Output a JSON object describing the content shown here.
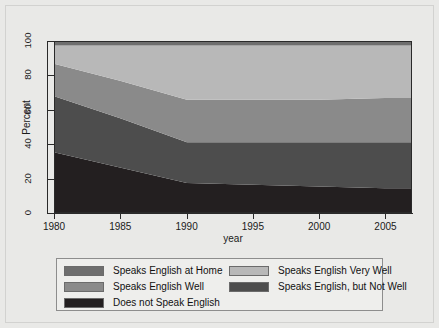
{
  "chart_data": {
    "type": "area",
    "title": "",
    "xlabel": "year",
    "ylabel": "Percent",
    "xlim": [
      1980,
      2007
    ],
    "ylim": [
      0,
      100
    ],
    "xticks": [
      1980,
      1985,
      1990,
      1995,
      2000,
      2005
    ],
    "yticks": [
      0,
      20,
      40,
      60,
      80,
      100
    ],
    "grid": false,
    "stacked": true,
    "stack_order_bottom_to_top": [
      "Does not Speak English",
      "Speaks English, but Not Well",
      "Speaks English Well",
      "Speaks English Very Well",
      "Speaks English at Home"
    ],
    "x": [
      1980,
      1985,
      1990,
      1995,
      2000,
      2005,
      2007
    ],
    "series": [
      {
        "name": "Does not Speak English",
        "color": "#231f20",
        "values": [
          35,
          26,
          17,
          16,
          15,
          14,
          14
        ]
      },
      {
        "name": "Speaks English, but Not Well",
        "color": "#4d4d4d",
        "values": [
          33,
          29,
          24,
          25,
          26,
          27,
          27
        ]
      },
      {
        "name": "Speaks English Well",
        "color": "#8a8a8a",
        "values": [
          19,
          22,
          25,
          25,
          25,
          26,
          26
        ]
      },
      {
        "name": "Speaks English Very Well",
        "color": "#b8b8b8",
        "values": [
          11,
          21,
          32,
          32,
          32,
          31,
          31
        ]
      },
      {
        "name": "Speaks English at Home",
        "color": "#6e6e6e",
        "values": [
          2,
          2,
          2,
          2,
          2,
          2,
          2
        ]
      }
    ],
    "cumulative_upper_boundaries": {
      "1980": [
        35,
        68,
        87,
        98,
        100
      ],
      "1985": [
        26,
        55,
        77,
        98,
        100
      ],
      "1990": [
        17,
        41,
        66,
        98,
        100
      ],
      "1995": [
        16,
        41,
        66,
        98,
        100
      ],
      "2000": [
        15,
        41,
        66,
        98,
        100
      ],
      "2005": [
        14,
        41,
        67,
        98,
        100
      ],
      "2007": [
        14,
        41,
        68,
        98,
        100
      ]
    }
  },
  "legend": {
    "columns": [
      {
        "items": [
          {
            "label": "Speaks English at Home",
            "color": "#6e6e6e"
          },
          {
            "label": "Speaks English Well",
            "color": "#8a8a8a"
          },
          {
            "label": "Does not Speak English",
            "color": "#231f20"
          }
        ]
      },
      {
        "items": [
          {
            "label": "Speaks English Very Well",
            "color": "#b8b8b8"
          },
          {
            "label": "Speaks English, but Not Well",
            "color": "#4d4d4d"
          }
        ]
      }
    ]
  },
  "axis": {
    "y_label": "Percent",
    "x_label": "year",
    "y_tick_labels": [
      "0",
      "20",
      "40",
      "60",
      "80",
      "100"
    ],
    "x_tick_labels": [
      "1980",
      "1985",
      "1990",
      "1995",
      "2000",
      "2005"
    ]
  },
  "colors": {
    "background": "#e9e9e7",
    "plot_background": "#ffffff",
    "axis": "#2a2a2a",
    "legend_background": "#eeeeec",
    "legend_border": "#8d8d8d"
  }
}
